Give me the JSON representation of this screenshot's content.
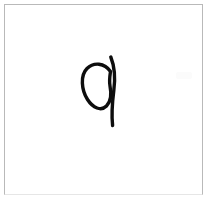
{
  "canvas": {
    "width": 211,
    "height": 198,
    "background_color": "#ffffff",
    "border_color": "#b9b9b9",
    "border_bottom_color": "#e6e6e6",
    "border_inset_px": 4,
    "alt_text": "White square canvas with a thin light gray border containing a single hand-drawn black glyph"
  },
  "drawing": {
    "name": "handwritten-glyph",
    "description": "Hand-drawn lowercase q-like glyph: an elliptical loop on the left whose stroke crosses a long, gently curved vertical stem on the right",
    "ink_color": "#0d0d0d",
    "stroke_width": 3.4,
    "bounding_box": {
      "x": 82,
      "y": 56,
      "width": 33,
      "height": 70
    },
    "strokes": [
      {
        "name": "loop-and-tail",
        "path": "M 110.5 71.5 C 104.5 62.5 93.5 62.0 87.0 68.5 C 80.0 75.5 81.5 90.0 87.5 99.5 C 93.0 108.0 101.0 111.5 106.5 106.0 C 111.0 101.5 111.5 93.5 110.0 86.0 C 109.0 80.5 110.0 75.0 110.5 71.5 Z"
      },
      {
        "name": "vertical-stem",
        "path": "M 110.8 57.0 C 114.6 66.5 115.4 78.5 113.8 90.5 C 112.4 101.5 111.3 114.0 112.6 125.5"
      }
    ]
  },
  "artifact": {
    "name": "faint-smudge",
    "color": "#fbfbfb",
    "position": {
      "x": 176,
      "y": 72
    }
  }
}
